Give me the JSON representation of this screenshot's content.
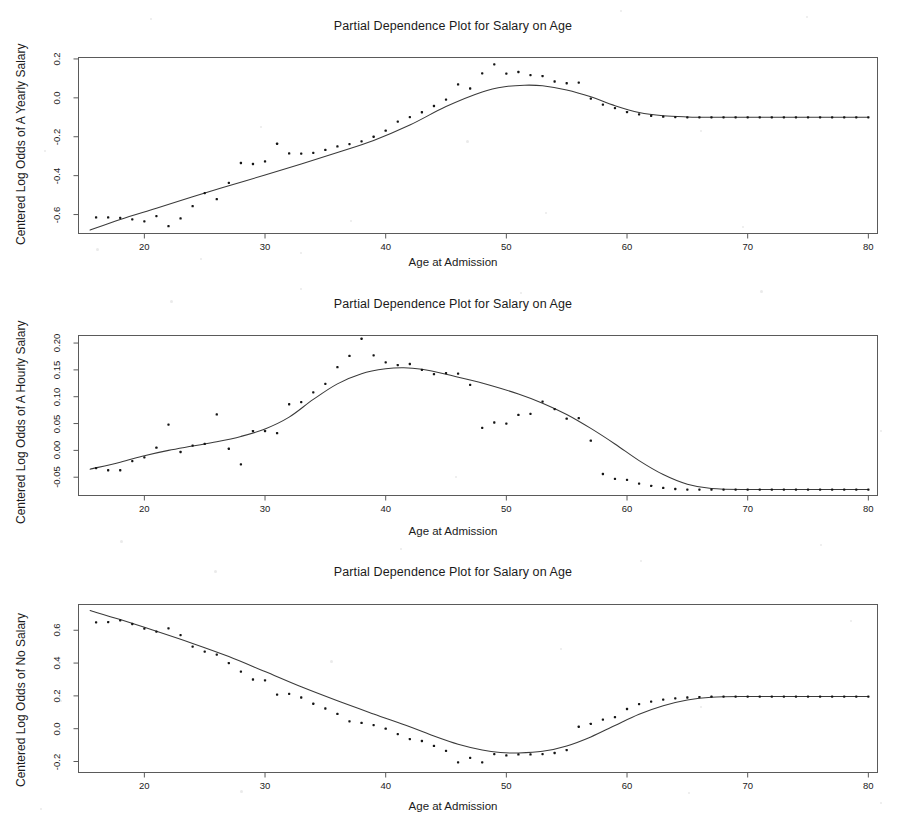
{
  "figure": {
    "background": "#ffffff",
    "axis_color": "#5a5a5a",
    "curve_color": "#3a3a3a",
    "point_color": "#151515"
  },
  "panels": [
    {
      "title": "Partial Dependence Plot for Salary on Age",
      "xlabel": "Age at Admission",
      "ylabel": "Centered Log Odds of A Yearly Salary",
      "yticks": [
        "0.2",
        "0.0",
        "-0.2",
        "-0.4",
        "-0.6"
      ],
      "xticks": [
        "20",
        "30",
        "40",
        "50",
        "60",
        "70",
        "80"
      ]
    },
    {
      "title": "Partial Dependence Plot for Salary on Age",
      "xlabel": "Age at Admission",
      "ylabel": "Centered Log Odds of A Hourly Salary",
      "yticks": [
        "0.20",
        "0.15",
        "0.10",
        "0.05",
        "0.00",
        "-0.05"
      ],
      "xticks": [
        "20",
        "30",
        "40",
        "50",
        "60",
        "70",
        "80"
      ]
    },
    {
      "title": "Partial Dependence Plot for Salary on Age",
      "xlabel": "Age at Admission",
      "ylabel": "Centered Log Odds of No Salary",
      "yticks": [
        "0.6",
        "0.4",
        "0.2",
        "0.0",
        "-0.2"
      ],
      "xticks": [
        "20",
        "30",
        "40",
        "50",
        "60",
        "70",
        "80"
      ]
    }
  ],
  "chart_data": [
    {
      "type": "scatter",
      "title": "Partial Dependence Plot for Salary on Age",
      "xlabel": "Age at Admission",
      "ylabel": "Centered Log Odds of A Yearly Salary",
      "xlim": [
        14.5,
        80.8
      ],
      "ylim": [
        -0.7,
        0.21
      ],
      "yticks": [
        0.2,
        0.0,
        -0.2,
        -0.4,
        -0.6
      ],
      "xticks": [
        20,
        30,
        40,
        50,
        60,
        70,
        80
      ],
      "grid": false,
      "legend": null,
      "series": [
        {
          "name": "partial dependence points",
          "kind": "scatter",
          "x": [
            16,
            17,
            18,
            19,
            20,
            21,
            22,
            23,
            24,
            25,
            26,
            27,
            28,
            29,
            30,
            31,
            32,
            33,
            34,
            35,
            36,
            37,
            38,
            39,
            40,
            41,
            42,
            43,
            44,
            45,
            46,
            47,
            48,
            49,
            50,
            51,
            52,
            53,
            54,
            55,
            56,
            57,
            58,
            59,
            60,
            61,
            62,
            63,
            64,
            65,
            66,
            67,
            68,
            69,
            70,
            71,
            72,
            73,
            74,
            75,
            76,
            77,
            78,
            79,
            80
          ],
          "y": [
            -0.615,
            -0.615,
            -0.617,
            -0.625,
            -0.635,
            -0.608,
            -0.66,
            -0.62,
            -0.557,
            -0.49,
            -0.521,
            -0.437,
            -0.335,
            -0.34,
            -0.327,
            -0.236,
            -0.286,
            -0.287,
            -0.283,
            -0.268,
            -0.25,
            -0.238,
            -0.224,
            -0.2,
            -0.169,
            -0.122,
            -0.099,
            -0.074,
            -0.042,
            -0.009,
            0.069,
            0.048,
            0.126,
            0.172,
            0.125,
            0.133,
            0.117,
            0.112,
            0.084,
            0.075,
            0.078,
            -0.004,
            -0.035,
            -0.053,
            -0.073,
            -0.085,
            -0.092,
            -0.097,
            -0.099,
            -0.1,
            -0.1,
            -0.1,
            -0.1,
            -0.1,
            -0.1,
            -0.1,
            -0.1,
            -0.1,
            -0.1,
            -0.1,
            -0.1,
            -0.1,
            -0.1,
            -0.1,
            -0.1
          ]
        },
        {
          "name": "smoothed partial dependence curve",
          "kind": "line",
          "x": [
            15.5,
            18,
            21,
            24,
            27,
            30,
            33,
            36,
            39,
            42,
            45,
            48,
            50,
            51.5,
            53,
            55,
            57,
            59,
            61,
            63,
            65,
            67,
            70,
            75,
            80
          ],
          "y": [
            -0.68,
            -0.625,
            -0.567,
            -0.508,
            -0.452,
            -0.397,
            -0.34,
            -0.281,
            -0.219,
            -0.14,
            -0.045,
            0.03,
            0.058,
            0.065,
            0.062,
            0.04,
            0.005,
            -0.04,
            -0.075,
            -0.092,
            -0.098,
            -0.1,
            -0.1,
            -0.1,
            -0.1
          ]
        }
      ]
    },
    {
      "type": "scatter",
      "title": "Partial Dependence Plot for Salary on Age",
      "xlabel": "Age at Admission",
      "ylabel": "Centered Log Odds of A Hourly Salary",
      "xlim": [
        14.5,
        80.8
      ],
      "ylim": [
        -0.085,
        0.215
      ],
      "yticks": [
        0.2,
        0.15,
        0.1,
        0.05,
        0.0,
        -0.05
      ],
      "xticks": [
        20,
        30,
        40,
        50,
        60,
        70,
        80
      ],
      "grid": false,
      "legend": null,
      "series": [
        {
          "name": "partial dependence points",
          "kind": "scatter",
          "x": [
            16,
            17,
            18,
            19,
            20,
            21,
            22,
            23,
            24,
            25,
            26,
            27,
            28,
            29,
            30,
            31,
            32,
            33,
            34,
            35,
            36,
            37,
            38,
            39,
            40,
            41,
            42,
            43,
            44,
            45,
            46,
            47,
            48,
            49,
            50,
            51,
            52,
            53,
            54,
            55,
            56,
            57,
            58,
            59,
            60,
            61,
            62,
            63,
            64,
            65,
            66,
            67,
            68,
            69,
            70,
            71,
            72,
            73,
            74,
            75,
            76,
            77,
            78,
            79,
            80
          ],
          "y": [
            -0.033,
            -0.037,
            -0.037,
            -0.02,
            -0.013,
            0.005,
            0.048,
            -0.003,
            0.009,
            0.012,
            0.067,
            0.003,
            -0.026,
            0.036,
            0.036,
            0.032,
            0.086,
            0.09,
            0.108,
            0.124,
            0.155,
            0.176,
            0.208,
            0.177,
            0.164,
            0.159,
            0.161,
            0.15,
            0.142,
            0.144,
            0.143,
            0.122,
            0.042,
            0.052,
            0.05,
            0.066,
            0.068,
            0.091,
            0.077,
            0.059,
            0.06,
            0.018,
            -0.044,
            -0.053,
            -0.055,
            -0.062,
            -0.066,
            -0.07,
            -0.072,
            -0.073,
            -0.073,
            -0.073,
            -0.073,
            -0.073,
            -0.073,
            -0.073,
            -0.073,
            -0.073,
            -0.073,
            -0.073,
            -0.073,
            -0.073,
            -0.073,
            -0.073,
            -0.073
          ]
        },
        {
          "name": "smoothed partial dependence curve",
          "kind": "line",
          "x": [
            15.5,
            18,
            20,
            22,
            24,
            26,
            28,
            30,
            32,
            34,
            36,
            38,
            40,
            41.5,
            43,
            45,
            47,
            49,
            51,
            53,
            55,
            57,
            59,
            61,
            63,
            65,
            67,
            70,
            75,
            80
          ],
          "y": [
            -0.035,
            -0.022,
            -0.01,
            0.0,
            0.008,
            0.016,
            0.026,
            0.04,
            0.062,
            0.095,
            0.124,
            0.143,
            0.152,
            0.154,
            0.151,
            0.142,
            0.131,
            0.119,
            0.105,
            0.088,
            0.067,
            0.041,
            0.012,
            -0.019,
            -0.045,
            -0.063,
            -0.071,
            -0.073,
            -0.073,
            -0.073
          ]
        }
      ]
    },
    {
      "type": "scatter",
      "title": "Partial Dependence Plot for Salary on Age",
      "xlabel": "Age at Admission",
      "ylabel": "Centered Log Odds of No Salary",
      "xlim": [
        14.5,
        80.8
      ],
      "ylim": [
        -0.27,
        0.76
      ],
      "yticks": [
        0.6,
        0.4,
        0.2,
        0.0,
        -0.2
      ],
      "xticks": [
        20,
        30,
        40,
        50,
        60,
        70,
        80
      ],
      "grid": false,
      "legend": null,
      "series": [
        {
          "name": "partial dependence points",
          "kind": "scatter",
          "x": [
            16,
            17,
            18,
            19,
            20,
            21,
            22,
            23,
            24,
            25,
            26,
            27,
            28,
            29,
            30,
            31,
            32,
            33,
            34,
            35,
            36,
            37,
            38,
            39,
            40,
            41,
            42,
            43,
            44,
            45,
            46,
            47,
            48,
            49,
            50,
            51,
            52,
            53,
            54,
            55,
            56,
            57,
            58,
            59,
            60,
            61,
            62,
            63,
            64,
            65,
            66,
            67,
            68,
            69,
            70,
            71,
            72,
            73,
            74,
            75,
            76,
            77,
            78,
            79,
            80
          ],
          "y": [
            0.648,
            0.65,
            0.66,
            0.638,
            0.61,
            0.592,
            0.612,
            0.57,
            0.5,
            0.47,
            0.452,
            0.4,
            0.348,
            0.3,
            0.295,
            0.208,
            0.212,
            0.19,
            0.152,
            0.123,
            0.09,
            0.045,
            0.035,
            0.022,
            0.0,
            -0.033,
            -0.063,
            -0.075,
            -0.105,
            -0.135,
            -0.205,
            -0.178,
            -0.205,
            -0.155,
            -0.163,
            -0.157,
            -0.157,
            -0.155,
            -0.148,
            -0.13,
            0.012,
            0.03,
            0.055,
            0.07,
            0.12,
            0.15,
            0.165,
            0.177,
            0.185,
            0.19,
            0.193,
            0.195,
            0.196,
            0.196,
            0.196,
            0.196,
            0.196,
            0.196,
            0.196,
            0.196,
            0.196,
            0.196,
            0.196,
            0.196,
            0.196
          ]
        },
        {
          "name": "smoothed partial dependence curve",
          "kind": "line",
          "x": [
            15.5,
            18,
            21,
            24,
            27,
            30,
            33,
            36,
            39,
            42,
            44,
            46,
            48,
            49.5,
            51,
            53,
            55,
            57,
            59,
            61,
            63,
            65,
            67,
            70,
            75,
            80
          ],
          "y": [
            0.72,
            0.665,
            0.594,
            0.52,
            0.44,
            0.348,
            0.255,
            0.17,
            0.09,
            0.012,
            -0.045,
            -0.095,
            -0.13,
            -0.145,
            -0.148,
            -0.138,
            -0.105,
            -0.05,
            0.02,
            0.088,
            0.14,
            0.175,
            0.192,
            0.196,
            0.196,
            0.196
          ]
        }
      ]
    }
  ]
}
